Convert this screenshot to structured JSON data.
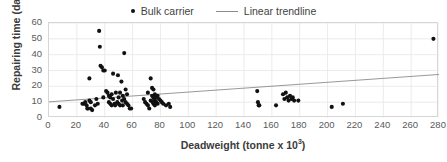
{
  "chart_data": {
    "type": "scatter",
    "title": "",
    "xlabel": "Deadweight (tonne x 10³)",
    "ylabel": "Repairing time (day)",
    "xlim": [
      0,
      280
    ],
    "ylim": [
      0,
      60
    ],
    "xticks": [
      0,
      20,
      40,
      60,
      80,
      100,
      120,
      140,
      160,
      180,
      200,
      220,
      240,
      260,
      280
    ],
    "yticks": [
      0,
      10,
      20,
      30,
      40,
      50,
      60
    ],
    "grid": true,
    "legend_position": "top-center",
    "marker_color": "#111111",
    "trendline_color": "#8c8c8c",
    "grid_color": "#e6e6e6",
    "series": [
      {
        "name": "Bulk carrier",
        "type": "scatter",
        "points": [
          [
            7.5,
            7
          ],
          [
            24,
            9
          ],
          [
            25,
            9
          ],
          [
            26,
            10
          ],
          [
            27,
            8
          ],
          [
            27.5,
            6
          ],
          [
            28,
            6
          ],
          [
            29,
            25
          ],
          [
            29,
            11
          ],
          [
            30,
            10
          ],
          [
            30,
            6
          ],
          [
            31,
            5
          ],
          [
            33,
            8
          ],
          [
            34,
            12
          ],
          [
            35,
            9
          ],
          [
            36,
            55
          ],
          [
            36.5,
            45
          ],
          [
            37,
            33
          ],
          [
            38,
            32
          ],
          [
            39,
            30
          ],
          [
            39,
            13
          ],
          [
            40,
            30
          ],
          [
            41,
            17
          ],
          [
            42,
            16
          ],
          [
            43,
            14
          ],
          [
            43,
            10
          ],
          [
            44,
            13
          ],
          [
            44,
            9
          ],
          [
            45,
            15
          ],
          [
            45,
            8
          ],
          [
            46,
            28
          ],
          [
            46,
            12
          ],
          [
            47,
            9
          ],
          [
            47.5,
            8
          ],
          [
            48,
            16
          ],
          [
            49,
            10
          ],
          [
            49.5,
            27
          ],
          [
            50,
            13
          ],
          [
            50,
            9
          ],
          [
            51,
            16
          ],
          [
            51,
            8
          ],
          [
            52,
            23
          ],
          [
            52.5,
            11
          ],
          [
            53,
            14
          ],
          [
            53,
            8
          ],
          [
            54,
            41
          ],
          [
            54,
            12
          ],
          [
            55,
            18
          ],
          [
            55,
            10
          ],
          [
            56,
            15
          ],
          [
            56,
            9
          ],
          [
            57,
            8
          ],
          [
            58,
            6
          ],
          [
            59,
            6
          ],
          [
            68,
            12
          ],
          [
            69,
            10
          ],
          [
            70,
            9
          ],
          [
            71,
            16
          ],
          [
            71,
            8
          ],
          [
            72,
            6
          ],
          [
            73,
            25
          ],
          [
            73,
            11
          ],
          [
            74,
            19
          ],
          [
            74,
            14
          ],
          [
            74.5,
            10
          ],
          [
            75,
            18
          ],
          [
            75,
            13
          ],
          [
            75,
            9
          ],
          [
            75.5,
            12
          ],
          [
            76,
            15
          ],
          [
            76,
            11
          ],
          [
            76,
            8
          ],
          [
            77,
            13
          ],
          [
            77,
            10
          ],
          [
            78,
            14
          ],
          [
            78,
            9
          ],
          [
            79,
            12
          ],
          [
            80,
            11
          ],
          [
            81,
            10
          ],
          [
            82,
            9
          ],
          [
            84,
            8
          ],
          [
            86,
            9
          ],
          [
            87,
            7
          ],
          [
            149.5,
            17
          ],
          [
            150,
            10
          ],
          [
            150.5,
            8
          ],
          [
            151,
            8
          ],
          [
            163,
            8
          ],
          [
            168,
            15
          ],
          [
            169,
            12
          ],
          [
            170,
            16
          ],
          [
            171,
            13
          ],
          [
            172,
            11
          ],
          [
            173,
            14
          ],
          [
            174,
            12
          ],
          [
            175,
            13
          ],
          [
            176,
            11
          ],
          [
            179,
            11
          ],
          [
            203,
            7
          ],
          [
            211,
            9
          ],
          [
            276,
            50
          ]
        ]
      }
    ],
    "trendline": {
      "name": "Linear trendline",
      "type": "line",
      "x_start": 0,
      "y_start": 10.2,
      "x_end": 280,
      "y_end": 27.5
    }
  },
  "legend": {
    "entries": [
      {
        "label": "Bulk carrier",
        "marker": "dot-marker-icon"
      },
      {
        "label": "Linear trendline",
        "marker": "line-marker-icon"
      }
    ]
  },
  "axes": {
    "y_title": "Repairing time (day)",
    "x_title_main": "Deadweight (tonne x 10",
    "x_title_sup": "3",
    "x_title_tail": ")"
  }
}
